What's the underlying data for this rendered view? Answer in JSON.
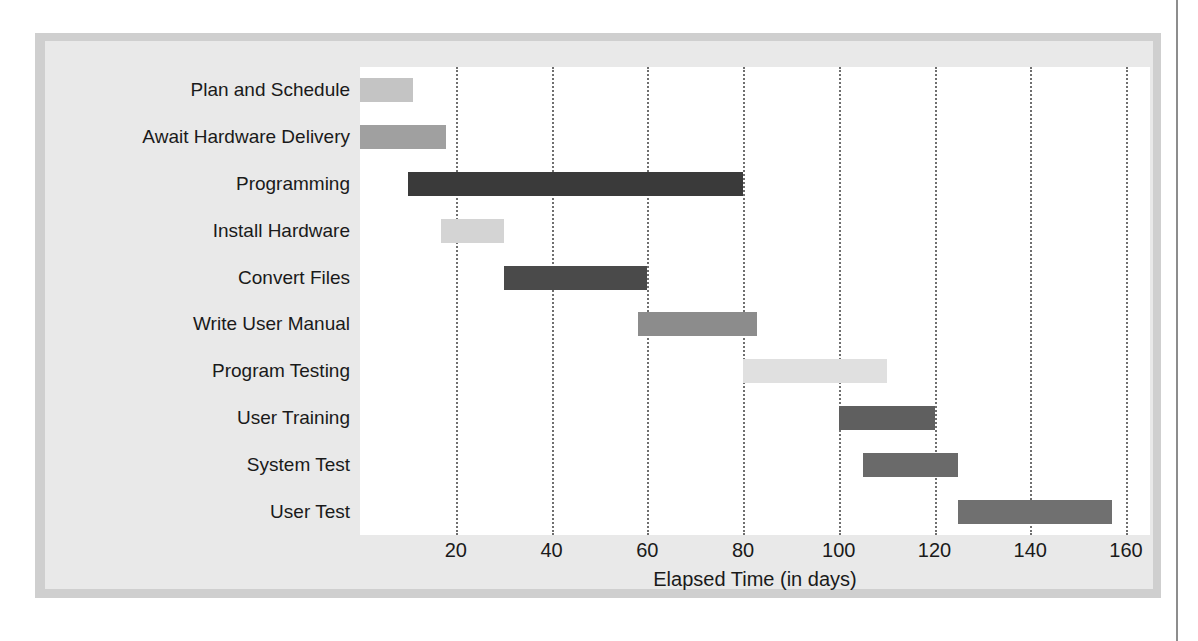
{
  "chart_data": {
    "type": "bar",
    "subtype": "gantt",
    "title": "",
    "xlabel": "Elapsed Time (in days)",
    "ylabel": "",
    "xlim": [
      0,
      165
    ],
    "xticks": [
      20,
      40,
      60,
      80,
      100,
      120,
      140,
      160
    ],
    "xtick_labels": [
      "20",
      "40",
      "60",
      "80",
      "100",
      "120",
      "140",
      "160"
    ],
    "grid": "vertical-dotted",
    "legend": "none",
    "categories": [
      "Plan and Schedule",
      "Await Hardware Delivery",
      "Programming",
      "Install Hardware",
      "Convert Files",
      "Write User Manual",
      "Program Testing",
      "User Training",
      "System Test",
      "User Test"
    ],
    "tasks": [
      {
        "label": "Plan and Schedule",
        "start": 0,
        "end": 11,
        "duration": 11,
        "color": "#c4c4c4"
      },
      {
        "label": "Await Hardware Delivery",
        "start": 0,
        "end": 18,
        "duration": 18,
        "color": "#a0a0a0"
      },
      {
        "label": "Programming",
        "start": 10,
        "end": 80,
        "duration": 70,
        "color": "#3a3a3a"
      },
      {
        "label": "Install Hardware",
        "start": 17,
        "end": 30,
        "duration": 13,
        "color": "#d4d4d4"
      },
      {
        "label": "Convert Files",
        "start": 30,
        "end": 60,
        "duration": 30,
        "color": "#4a4a4a"
      },
      {
        "label": "Write User Manual",
        "start": 58,
        "end": 83,
        "duration": 25,
        "color": "#8c8c8c"
      },
      {
        "label": "Program Testing",
        "start": 80,
        "end": 110,
        "duration": 30,
        "color": "#e0e0e0"
      },
      {
        "label": "User Training",
        "start": 100,
        "end": 120,
        "duration": 20,
        "color": "#5f5f5f"
      },
      {
        "label": "System Test",
        "start": 105,
        "end": 125,
        "duration": 20,
        "color": "#6a6a6a"
      },
      {
        "label": "User Test",
        "start": 125,
        "end": 157,
        "duration": 32,
        "color": "#707070"
      }
    ]
  },
  "figure": {
    "frame_color": "#cfcfcf",
    "panel_color": "#e9e9e9",
    "plot_background": "#ffffff",
    "gridline_color": "#6f6f6f"
  }
}
